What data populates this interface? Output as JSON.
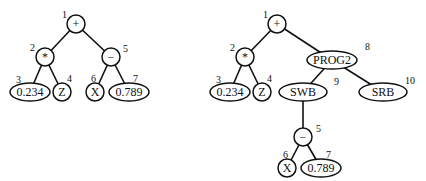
{
  "trees": [
    {
      "name": "original-tree",
      "nodes": [
        {
          "id": 1,
          "label": "+",
          "x": 76,
          "y": 24,
          "rx": 9,
          "ry": 9,
          "lx": 62,
          "ly": 18
        },
        {
          "id": 2,
          "label": "*",
          "x": 45,
          "y": 57,
          "rx": 9,
          "ry": 9,
          "lx": 30,
          "ly": 51
        },
        {
          "id": 5,
          "label": "−",
          "x": 111,
          "y": 57,
          "rx": 9,
          "ry": 9,
          "lx": 123,
          "ly": 52
        },
        {
          "id": 3,
          "label": "0.234",
          "x": 30,
          "y": 92,
          "rx": 20,
          "ry": 9,
          "lx": 16,
          "ly": 83
        },
        {
          "id": 4,
          "label": "Z",
          "x": 62,
          "y": 92,
          "rx": 9,
          "ry": 9,
          "lx": 67,
          "ly": 82
        },
        {
          "id": 6,
          "label": "X",
          "x": 95,
          "y": 92,
          "rx": 9,
          "ry": 9,
          "lx": 91,
          "ly": 82
        },
        {
          "id": 7,
          "label": "0.789",
          "x": 129,
          "y": 92,
          "rx": 20,
          "ry": 9,
          "lx": 133,
          "ly": 82
        }
      ],
      "edges": [
        [
          1,
          2
        ],
        [
          1,
          5
        ],
        [
          2,
          3
        ],
        [
          2,
          4
        ],
        [
          5,
          6
        ],
        [
          5,
          7
        ]
      ]
    },
    {
      "name": "modified-tree",
      "nodes": [
        {
          "id": 1,
          "label": "+",
          "x": 277,
          "y": 24,
          "rx": 9,
          "ry": 9,
          "lx": 263,
          "ly": 18
        },
        {
          "id": 2,
          "label": "*",
          "x": 245,
          "y": 57,
          "rx": 9,
          "ry": 9,
          "lx": 230,
          "ly": 51
        },
        {
          "id": 8,
          "label": "PROG2",
          "x": 332,
          "y": 60,
          "rx": 25,
          "ry": 9,
          "lx": 365,
          "ly": 50
        },
        {
          "id": 3,
          "label": "0.234",
          "x": 230,
          "y": 92,
          "rx": 20,
          "ry": 9,
          "lx": 216,
          "ly": 83
        },
        {
          "id": 4,
          "label": "Z",
          "x": 262,
          "y": 92,
          "rx": 9,
          "ry": 9,
          "lx": 267,
          "ly": 82
        },
        {
          "id": 9,
          "label": "SWB",
          "x": 303,
          "y": 92,
          "rx": 24,
          "ry": 9,
          "lx": 334,
          "ly": 85
        },
        {
          "id": 10,
          "label": "SRB",
          "x": 383,
          "y": 92,
          "rx": 24,
          "ry": 9,
          "lx": 405,
          "ly": 84
        },
        {
          "id": 5,
          "label": "−",
          "x": 303,
          "y": 137,
          "rx": 9,
          "ry": 9,
          "lx": 316,
          "ly": 132
        },
        {
          "id": 6,
          "label": "X",
          "x": 287,
          "y": 168,
          "rx": 9,
          "ry": 9,
          "lx": 283,
          "ly": 158
        },
        {
          "id": 7,
          "label": "0.789",
          "x": 321,
          "y": 168,
          "rx": 20,
          "ry": 9,
          "lx": 326,
          "ly": 158
        }
      ],
      "edges": [
        [
          1,
          2
        ],
        [
          1,
          8
        ],
        [
          2,
          3
        ],
        [
          2,
          4
        ],
        [
          8,
          9
        ],
        [
          8,
          10
        ],
        [
          9,
          5
        ],
        [
          5,
          6
        ],
        [
          5,
          7
        ]
      ]
    }
  ]
}
